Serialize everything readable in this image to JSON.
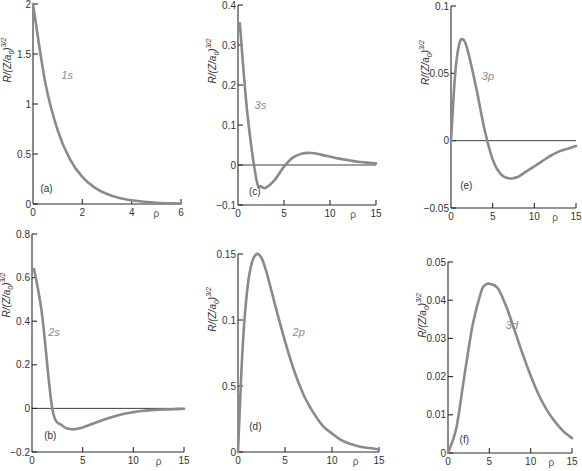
{
  "colors": {
    "curve": "#8a8a8a",
    "axis": "#2a2a2a",
    "text": "#333333"
  },
  "chart_data": [
    {
      "id": "a",
      "type": "line",
      "panel_label": "(a)",
      "series_label": "1s",
      "ylabel": "R/(Z/a0)^3/2",
      "xlabel": "ρ",
      "xlim": [
        0,
        6
      ],
      "ylim": [
        0,
        2
      ],
      "xticks": [
        0,
        2,
        4,
        6
      ],
      "xtick_labels": [
        "0",
        "2",
        "4",
        "6"
      ],
      "yticks": [
        0,
        0.5,
        1,
        1.5,
        2
      ],
      "ytick_labels": [
        "0",
        "0.5",
        "1",
        "1.5",
        "2"
      ],
      "zero_line": false,
      "px": {
        "x0": 33,
        "x1": 181,
        "y0": 204,
        "y1": 4
      },
      "label_pos": [
        1.15,
        1.25
      ],
      "panel_label_pos": [
        0.3,
        0.12
      ],
      "x": [
        0,
        0.5,
        1,
        1.5,
        2,
        2.5,
        3,
        3.5,
        4,
        4.5,
        5,
        5.5,
        6
      ],
      "values": [
        2.0,
        1.213,
        0.736,
        0.446,
        0.271,
        0.164,
        0.1,
        0.06,
        0.037,
        0.022,
        0.013,
        0.008,
        0.005
      ]
    },
    {
      "id": "b",
      "type": "line",
      "panel_label": "(b)",
      "series_label": "2s",
      "ylabel": "R/(Z/a0)^3/2",
      "xlabel": "ρ",
      "xlim": [
        0,
        15
      ],
      "ylim": [
        -0.2,
        0.8
      ],
      "xticks": [
        0,
        5,
        10,
        15
      ],
      "xtick_labels": [
        "0",
        "5",
        "10",
        "15"
      ],
      "yticks": [
        -0.2,
        0,
        0.2,
        0.4,
        0.6,
        0.8
      ],
      "ytick_labels": [
        "-0.2",
        "0",
        "0.2",
        "0.4",
        "0.6",
        "0.8"
      ],
      "zero_line": true,
      "px": {
        "x0": 32,
        "x1": 184,
        "y0": 452,
        "y1": 234
      },
      "label_pos": [
        1.6,
        0.33
      ],
      "panel_label_pos": [
        1.2,
        -0.14
      ],
      "x": [
        0.2,
        1,
        2,
        3,
        4,
        5,
        6,
        7,
        8,
        9,
        10,
        11,
        12,
        13,
        14,
        15
      ],
      "values": [
        0.639,
        0.429,
        0,
        -0.079,
        -0.096,
        -0.087,
        -0.07,
        -0.053,
        -0.038,
        -0.026,
        -0.017,
        -0.011,
        -0.007,
        -0.005,
        -0.003,
        -0.002
      ]
    },
    {
      "id": "c",
      "type": "line",
      "panel_label": "(c)",
      "series_label": "3s",
      "ylabel": "R/(Z/a0)^3/2",
      "xlabel": "ρ",
      "xlim": [
        0,
        15
      ],
      "ylim": [
        -0.1,
        0.4
      ],
      "xticks": [
        0,
        5,
        10,
        15
      ],
      "xtick_labels": [
        "0",
        "5",
        "10",
        "15"
      ],
      "yticks": [
        -0.1,
        0,
        0.1,
        0.2,
        0.3,
        0.4
      ],
      "ytick_labels": [
        "-0.1",
        "0",
        "0.1",
        "0.2",
        "0.3",
        "0.4"
      ],
      "zero_line": true,
      "px": {
        "x0": 238,
        "x1": 376,
        "y0": 205,
        "y1": 5
      },
      "label_pos": [
        1.8,
        0.14
      ],
      "panel_label_pos": [
        1.2,
        -0.075
      ],
      "x": [
        0.2,
        1,
        2,
        2.5,
        3,
        4,
        5,
        6,
        7,
        8,
        9,
        10,
        11,
        12,
        13,
        14,
        15
      ],
      "values": [
        0.354,
        0.133,
        -0.036,
        -0.053,
        -0.057,
        -0.037,
        -0.004,
        0.019,
        0.029,
        0.03,
        0.026,
        0.021,
        0.016,
        0.012,
        0.008,
        0.006,
        0.004
      ]
    },
    {
      "id": "d",
      "type": "line",
      "panel_label": "(d)",
      "series_label": "2p",
      "ylabel": "R/(Z/a0)^3/2",
      "xlabel": "ρ",
      "xlim": [
        0,
        15
      ],
      "ylim": [
        0,
        0.15
      ],
      "xticks": [
        0,
        5,
        10,
        15
      ],
      "xtick_labels": [
        "0",
        "5",
        "10",
        "15"
      ],
      "yticks": [
        0,
        0.05,
        0.1,
        0.15
      ],
      "ytick_labels": [
        "0",
        "0.5",
        "0.1",
        "0.15"
      ],
      "zero_line": false,
      "px": {
        "x0": 238,
        "x1": 379,
        "y0": 452,
        "y1": 254
      },
      "label_pos": [
        5.8,
        0.088
      ],
      "panel_label_pos": [
        1.2,
        0.017
      ],
      "x": [
        0,
        0.5,
        1,
        1.5,
        2,
        2.5,
        3,
        4,
        5,
        6,
        7,
        8,
        9,
        10,
        11,
        12,
        13,
        14,
        15
      ],
      "values": [
        0,
        0.08,
        0.124,
        0.144,
        0.15,
        0.147,
        0.137,
        0.11,
        0.084,
        0.061,
        0.043,
        0.03,
        0.02,
        0.014,
        0.009,
        0.006,
        0.004,
        0.003,
        0.002
      ]
    },
    {
      "id": "e",
      "type": "line",
      "panel_label": "(e)",
      "series_label": "3p",
      "ylabel": "R/(Z/a0)^3/2",
      "xlabel": "ρ",
      "xlim": [
        0,
        15
      ],
      "ylim": [
        -0.05,
        0.1
      ],
      "xticks": [
        0,
        5,
        10,
        15
      ],
      "xtick_labels": [
        "0",
        "5",
        "10",
        "15"
      ],
      "yticks": [
        -0.05,
        0,
        0.05,
        0.1
      ],
      "ytick_labels": [
        "-0.05",
        "0",
        "0.05",
        "0.1"
      ],
      "zero_line": true,
      "px": {
        "x0": 451,
        "x1": 576,
        "y0": 208,
        "y1": 6
      },
      "label_pos": [
        3.7,
        0.045
      ],
      "panel_label_pos": [
        1.1,
        -0.036
      ],
      "x": [
        0,
        0.5,
        1,
        1.5,
        2,
        3,
        4,
        5,
        6,
        7,
        8,
        9,
        10,
        11,
        12,
        13,
        14,
        15
      ],
      "values": [
        0,
        0.05,
        0.072,
        0.075,
        0.067,
        0.04,
        0.009,
        -0.014,
        -0.025,
        -0.028,
        -0.027,
        -0.023,
        -0.019,
        -0.015,
        -0.011,
        -0.008,
        -0.006,
        -0.004
      ]
    },
    {
      "id": "f",
      "type": "line",
      "panel_label": "(f)",
      "series_label": "3d",
      "ylabel": "R/(Z/a0)^3/2",
      "xlabel": "ρ",
      "xlim": [
        0,
        15
      ],
      "ylim": [
        0,
        0.05
      ],
      "xticks": [
        0,
        5,
        10,
        15
      ],
      "xtick_labels": [
        "0",
        "5",
        "10",
        "15"
      ],
      "yticks": [
        0,
        0.01,
        0.02,
        0.03,
        0.04,
        0.05
      ],
      "ytick_labels": [
        "0",
        "0.01",
        "0.02",
        "0.03",
        "0.04",
        "0.05"
      ],
      "zero_line": false,
      "px": {
        "x0": 448,
        "x1": 572,
        "y0": 453,
        "y1": 262
      },
      "label_pos": [
        7.0,
        0.0325
      ],
      "panel_label_pos": [
        1.4,
        0.0025
      ],
      "x": [
        0,
        1,
        2,
        3,
        4,
        4.5,
        5,
        6,
        7,
        8,
        9,
        10,
        11,
        12,
        13,
        14,
        15
      ],
      "values": [
        0,
        0.0065,
        0.0204,
        0.0337,
        0.0422,
        0.044,
        0.0443,
        0.0432,
        0.0386,
        0.0325,
        0.0261,
        0.0202,
        0.0151,
        0.0111,
        0.008,
        0.0056,
        0.0039
      ]
    }
  ]
}
